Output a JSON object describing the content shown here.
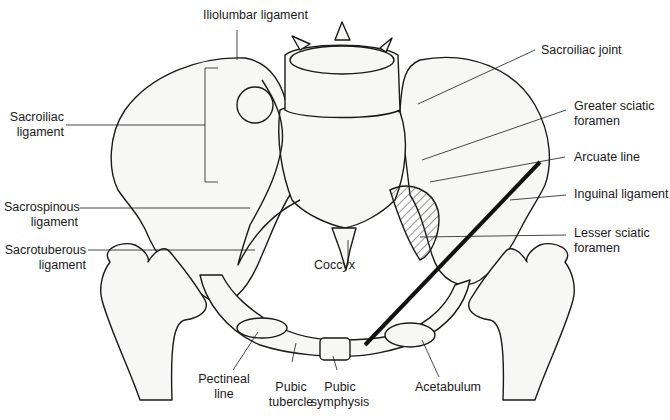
{
  "figure": {
    "colors": {
      "line": "#1a1a1a",
      "bone_fill": "#f7f7f5",
      "shade": "#cfcfcf",
      "background": "#ffffff"
    }
  },
  "labels": {
    "iliolumbar_ligament": {
      "line1": "Iliolumbar ligament"
    },
    "sacroiliac_ligament": {
      "line1": "Sacroiliac",
      "line2": "ligament"
    },
    "sacrospinous_ligament": {
      "line1": "Sacrospinous",
      "line2": "ligament"
    },
    "sacrotuberous_ligament": {
      "line1": "Sacrotuberous",
      "line2": "ligament"
    },
    "coccyx": {
      "line1": "Coccyx"
    },
    "sacroiliac_joint": {
      "line1": "Sacroiliac joint"
    },
    "greater_sciatic_foramen": {
      "line1": "Greater sciatic",
      "line2": "foramen"
    },
    "arcuate_line": {
      "line1": "Arcuate line"
    },
    "inguinal_ligament": {
      "line1": "Inguinal ligament"
    },
    "lesser_sciatic_foramen": {
      "line1": "Lesser sciatic",
      "line2": "foramen"
    },
    "pectineal_line": {
      "line1": "Pectineal",
      "line2": "line"
    },
    "pubic_tubercle": {
      "line1": "Pubic",
      "line2": "tubercle"
    },
    "pubic_symphysis": {
      "line1": "Pubic",
      "line2": "symphysis"
    },
    "acetabulum": {
      "line1": "Acetabulum"
    }
  }
}
